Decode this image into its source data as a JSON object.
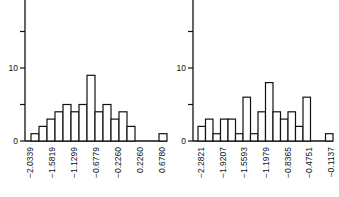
{
  "chart_data": [
    {
      "type": "bar",
      "title": "",
      "xlabel": "",
      "ylabel": "",
      "ylim": [
        0,
        17
      ],
      "yticks": [
        0,
        10
      ],
      "ytick_marks": [
        0,
        5,
        10,
        15
      ],
      "grid": false,
      "legend": null,
      "xtick_labels": [
        "−2.0339",
        "−1.5819",
        "−1.1299",
        "−0.6779",
        "−0.2260",
        "0.2260",
        "0.6780"
      ],
      "values": [
        1,
        2,
        3,
        4,
        5,
        4,
        5,
        9,
        4,
        5,
        3,
        4,
        2,
        0,
        0,
        0,
        1
      ]
    },
    {
      "type": "bar",
      "title": "",
      "xlabel": "",
      "ylabel": "",
      "ylim": [
        0,
        17
      ],
      "yticks": [
        0,
        10
      ],
      "ytick_marks": [
        0,
        5,
        10,
        15
      ],
      "grid": false,
      "legend": null,
      "xtick_labels": [
        "−2.2821",
        "−1.9207",
        "−1.5593",
        "−1.1979",
        "−0.8365",
        "−0.4751",
        "−0.1137"
      ],
      "values": [
        2,
        3,
        1,
        3,
        3,
        1,
        6,
        1,
        4,
        8,
        4,
        3,
        4,
        2,
        6,
        0,
        0,
        1
      ]
    }
  ]
}
